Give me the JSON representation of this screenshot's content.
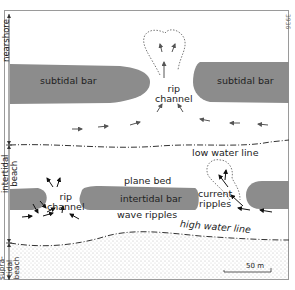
{
  "figure_number": "3936",
  "zones": {
    "nearshore": "nearshore",
    "intertidal": [
      "intertidal",
      "beach"
    ],
    "supratidal": [
      "supra-",
      "tidal",
      "beach"
    ]
  },
  "labels": {
    "subtidal_bar_left": "subtidal bar",
    "subtidal_bar_right": "subtidal bar",
    "rip_channel_top": [
      "rip",
      "channel"
    ],
    "low_water_line": "low water line",
    "plane_bed": "plane bed",
    "intertidal_bar": "intertidal bar",
    "wave_ripples": "wave ripples",
    "rip_channel_bottom": [
      "rip",
      "channel"
    ],
    "current_ripples": [
      "current",
      "ripples"
    ],
    "high_water_line": "high water line"
  },
  "scale_bar": {
    "label": "50 m"
  },
  "colors": {
    "bar_fill": "#8c8c8c",
    "frame": "#9a9a9a",
    "sand_dot": "#777777",
    "line": "#333333"
  }
}
